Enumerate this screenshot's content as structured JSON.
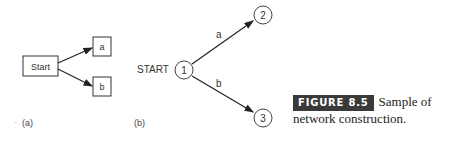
{
  "diagram_a": {
    "label": "(a)",
    "start_node": "Start",
    "nodes": [
      "a",
      "b"
    ],
    "edges": [
      {
        "from": "Start",
        "to": "a"
      },
      {
        "from": "Start",
        "to": "b"
      }
    ]
  },
  "diagram_b": {
    "label": "(b)",
    "start_label": "START",
    "nodes": [
      "1",
      "2",
      "3"
    ],
    "edges": [
      {
        "from": "1",
        "to": "2",
        "label": "a"
      },
      {
        "from": "1",
        "to": "3",
        "label": "b"
      }
    ]
  },
  "caption": {
    "figure_label": "FIGURE 8.5",
    "text": "Sample of network construction."
  }
}
